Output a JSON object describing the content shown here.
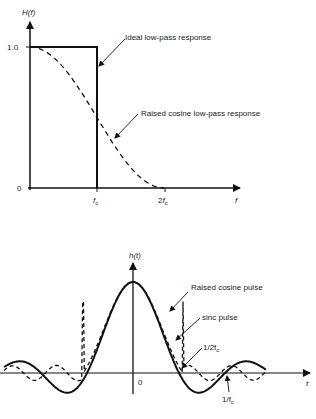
{
  "top_chart": {
    "y_label": "H(f)",
    "x_label": "f",
    "y_ticks": [
      "1.0",
      "0"
    ],
    "x_ticks": [
      {
        "main": "f",
        "sub": "c",
        "prefix": ""
      },
      {
        "main": "f",
        "sub": "c",
        "prefix": "2"
      }
    ],
    "annotations": {
      "ideal": "Ideal low-pass response",
      "raised": "Raised cosine low-pass response"
    }
  },
  "bottom_chart": {
    "y_label": "h(t)",
    "x_label": "t",
    "origin_label": "0",
    "annotations": {
      "raised": "Raised cosine pulse",
      "sinc": "sinc pulse",
      "half": "1/2f",
      "half_sub": "c",
      "full": "1/f",
      "full_sub": "c"
    }
  },
  "chart_data": [
    {
      "type": "line",
      "title": "",
      "xlabel": "f",
      "ylabel": "H(f)",
      "x_ticks": [
        "0",
        "fc",
        "2fc"
      ],
      "y_ticks": [
        "0",
        "1.0"
      ],
      "ylim": [
        0,
        1.0
      ],
      "series": [
        {
          "name": "Ideal low-pass response",
          "style": "solid",
          "x": [
            0,
            1,
            1,
            2
          ],
          "y": [
            1.0,
            1.0,
            0,
            0
          ]
        },
        {
          "name": "Raised cosine low-pass response",
          "style": "dashed",
          "x": [
            0,
            0.25,
            0.5,
            0.75,
            1.0,
            1.25,
            1.5,
            1.75,
            2.0
          ],
          "y": [
            1.0,
            0.96,
            0.85,
            0.69,
            0.5,
            0.31,
            0.15,
            0.04,
            0
          ]
        }
      ]
    },
    {
      "type": "line",
      "title": "",
      "xlabel": "t",
      "ylabel": "h(t)",
      "annotations": [
        "1/2fc",
        "1/fc",
        "0"
      ],
      "series": [
        {
          "name": "sinc pulse",
          "style": "solid",
          "zero_crossings_in_units_of_1_over_2fc": [
            1,
            2,
            3
          ]
        },
        {
          "name": "Raised cosine pulse",
          "style": "dashed"
        }
      ]
    }
  ]
}
